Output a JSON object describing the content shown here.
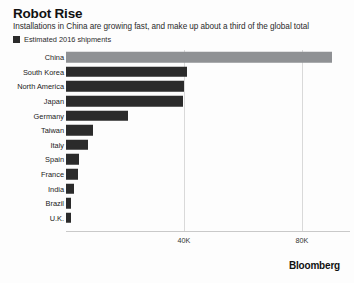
{
  "header": {
    "title": "Robot Rise",
    "subtitle": "Installations in China are growing fast, and make up about a third of the global total"
  },
  "legend": {
    "items": [
      {
        "label": "Estimated 2016 shipments",
        "color": "#2b2b2b"
      }
    ]
  },
  "brand": "Bloomberg",
  "colors": {
    "bar": "#2b2b2b",
    "bar_highlight": "#8f9194",
    "gridline": "#d9d9d9",
    "text": "#222222",
    "background": "#fdfdfd"
  },
  "chart_data": {
    "type": "bar",
    "orientation": "horizontal",
    "title": "Robot Rise",
    "subtitle": "Installations in China are growing fast, and make up about a third of the global total",
    "series_name": "Estimated 2016 shipments",
    "xlabel": "",
    "ylabel": "",
    "xlim": [
      0,
      98000
    ],
    "xticks": [
      40000,
      80000
    ],
    "xticklabels": [
      "40K",
      "80K"
    ],
    "grid": true,
    "legend_position": "top-left",
    "categories": [
      "China",
      "South Korea",
      "North America",
      "Japan",
      "Germany",
      "Taiwan",
      "Italy",
      "Spain",
      "France",
      "India",
      "Brazil",
      "U.K."
    ],
    "values": [
      90000,
      41000,
      40000,
      39500,
      21000,
      9000,
      7500,
      4500,
      4000,
      2800,
      1700,
      1700
    ],
    "highlight_category": "China"
  }
}
